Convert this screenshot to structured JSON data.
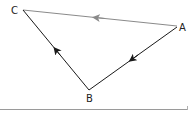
{
  "diagram": {
    "type": "vector-triangle",
    "vertices": {
      "A": {
        "label": "A"
      },
      "B": {
        "label": "B"
      },
      "C": {
        "label": "C"
      }
    },
    "edges": [
      {
        "from": "A",
        "to": "C",
        "color": "#8a8a8a"
      },
      {
        "from": "A",
        "to": "B",
        "color": "#1a1a1a"
      },
      {
        "from": "B",
        "to": "C",
        "color": "#1a1a1a"
      }
    ]
  }
}
